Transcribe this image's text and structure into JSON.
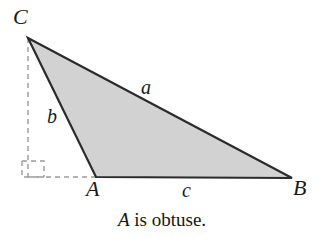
{
  "figure": {
    "name": "obtuse-triangle-diagram",
    "canvas": {
      "width": 324,
      "height": 238,
      "background": "#ffffff"
    },
    "style": {
      "fill_color": "#d2d2d2",
      "stroke_color": "#2b2b2b",
      "stroke_width": 2.2,
      "dash_color": "#9a9a9a",
      "dash_width": 1.4,
      "dash_pattern": "5,4"
    },
    "vertices": [
      {
        "name": "C",
        "label": "C",
        "x": 28,
        "y": 38
      },
      {
        "name": "A",
        "label": "A",
        "x": 96,
        "y": 177
      },
      {
        "name": "B",
        "label": "B",
        "x": 292,
        "y": 178
      }
    ],
    "sides": [
      {
        "name": "a",
        "label": "a",
        "from": "C",
        "to": "B"
      },
      {
        "name": "b",
        "label": "b",
        "from": "C",
        "to": "A"
      },
      {
        "name": "c",
        "label": "c",
        "from": "A",
        "to": "B"
      }
    ],
    "construction": {
      "altitude_foot": {
        "x": 28,
        "y": 177
      },
      "vertical_dashed": {
        "x1": 28,
        "y1": 38,
        "x2": 28,
        "y2": 177
      },
      "horizontal_dashed": {
        "x1": 28,
        "y1": 177,
        "x2": 98,
        "y2": 177
      },
      "right_angle_marker": {
        "x": 22,
        "y": 161,
        "width": 22,
        "height": 16
      }
    },
    "polygon_points": "28,38 292,178 96,177"
  },
  "caption": {
    "variable": "A",
    "rest": " is obtuse."
  }
}
